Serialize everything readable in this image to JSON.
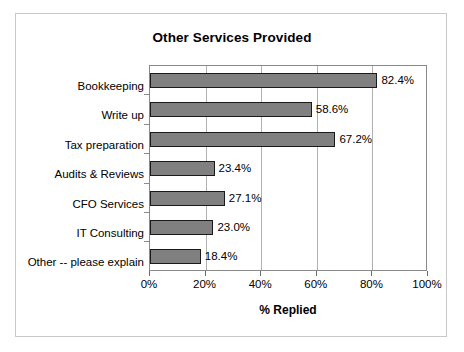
{
  "chart_data": {
    "type": "bar",
    "orientation": "horizontal",
    "title": "Other Services Provided",
    "xlabel": "% Replied",
    "ylabel": "",
    "categories": [
      "Bookkeeping",
      "Write up",
      "Tax preparation",
      "Audits & Reviews",
      "CFO Services",
      "IT Consulting",
      "Other -- please explain"
    ],
    "values": [
      82.4,
      58.6,
      67.2,
      23.4,
      27.1,
      23.0,
      18.4
    ],
    "data_labels": [
      "82.4%",
      "58.6%",
      "67.2%",
      "23.4%",
      "27.1%",
      "23.0%",
      "18.4%"
    ],
    "xlim": [
      0,
      100
    ],
    "xticks": [
      0,
      20,
      40,
      60,
      80,
      100
    ],
    "xtick_labels": [
      "0%",
      "20%",
      "40%",
      "60%",
      "80%",
      "100%"
    ],
    "grid": "vertical",
    "legend": null,
    "colors": {
      "bar_fill": "#808080",
      "bar_border": "#1a1a1a",
      "gridline": "#b0b0b0",
      "axis": "#8a8a8a",
      "text": "#000000",
      "background": "#ffffff",
      "frame": "#c8c8c8"
    }
  }
}
